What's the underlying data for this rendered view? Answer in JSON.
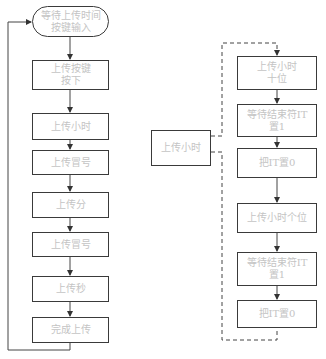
{
  "left_flow": {
    "nodes": [
      {
        "label": "等待上传时间\n按键输入",
        "shape": "terminal"
      },
      {
        "label": "上传按键\n按下"
      },
      {
        "label": "上传小时"
      },
      {
        "label": "上传冒号"
      },
      {
        "label": "上传分"
      },
      {
        "label": "上传冒号"
      },
      {
        "label": "上传秒"
      },
      {
        "label": "完成上传"
      }
    ],
    "loop_back": "from 完成上传 to 等待上传时间按键输入"
  },
  "detail_flow": {
    "source": {
      "label": "上传小时"
    },
    "nodes": [
      {
        "label": "上传小时\n十位"
      },
      {
        "label": "等待结束符IT\n置1"
      },
      {
        "label": "把IT置0"
      },
      {
        "label": "上传小时个位"
      },
      {
        "label": "等待结束符IT\n置1"
      },
      {
        "label": "把IT置0"
      }
    ]
  },
  "colors": {
    "border": "#3a3a3a",
    "text": "#c4c4c4",
    "line": "#444444"
  }
}
